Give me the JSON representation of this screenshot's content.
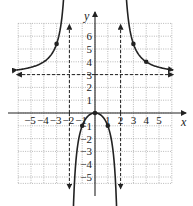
{
  "chart_data": {
    "type": "line",
    "title": "",
    "function": "f(x) = 3x^2 / (x^2 - 4)",
    "xlabel": "x",
    "ylabel": "y",
    "xlim": [
      -6,
      6
    ],
    "ylim": [
      -5.5,
      7
    ],
    "grid": true,
    "x_ticks": [
      -5,
      -4,
      -3,
      -2,
      -1,
      1,
      2,
      3,
      4,
      5
    ],
    "y_ticks": [
      -5,
      -4,
      -3,
      -2,
      -1,
      1,
      2,
      3,
      4,
      5,
      6
    ],
    "x_tick_labels": [
      "−5",
      "−4",
      "−3",
      "−2",
      "−1",
      "1",
      "2",
      "3",
      "4",
      "5"
    ],
    "y_tick_labels": [
      "−5",
      "−4",
      "−3",
      "−2",
      "−1",
      "1",
      "2",
      "3",
      "4",
      "5",
      "6"
    ],
    "asymptotes": {
      "vertical": [
        -2,
        2
      ],
      "horizontal": [
        3
      ]
    },
    "marked_points": [
      {
        "x": -3,
        "y": 5.4
      },
      {
        "x": -1,
        "y": -1
      },
      {
        "x": 0,
        "y": 0
      },
      {
        "x": 1,
        "y": -1
      },
      {
        "x": 3,
        "y": 5.4
      },
      {
        "x": 4,
        "y": 4
      }
    ],
    "series": [
      {
        "name": "left branch",
        "x": [
          -6,
          -5,
          -4,
          -3,
          -2.5,
          -2.3
        ],
        "y": [
          3.375,
          3.571,
          4,
          5.4,
          8.333,
          12.2
        ]
      },
      {
        "name": "middle branch",
        "x": [
          -1.8,
          -1.5,
          -1,
          -0.5,
          0,
          0.5,
          1,
          1.5,
          1.8
        ],
        "y": [
          -12.79,
          -3.857,
          -1,
          -0.2,
          0,
          -0.2,
          -1,
          -3.857,
          -12.79
        ]
      },
      {
        "name": "right branch",
        "x": [
          2.3,
          2.5,
          3,
          4,
          5,
          6
        ],
        "y": [
          12.2,
          8.333,
          5.4,
          4,
          3.571,
          3.375
        ]
      }
    ]
  }
}
